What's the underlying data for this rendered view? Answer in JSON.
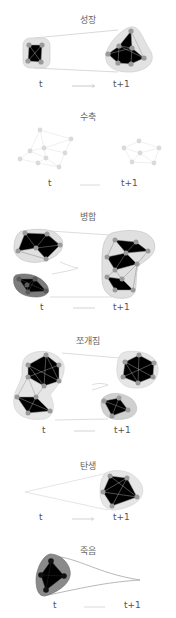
{
  "panels": [
    {
      "id": "growth",
      "title": "성장",
      "t_label": "t",
      "t1_label": "t+1"
    },
    {
      "id": "contraction",
      "title": "수축",
      "t_label": "t",
      "t1_label": "t+1"
    },
    {
      "id": "merging",
      "title": "병합",
      "t_label": "t",
      "t1_label": "t+1"
    },
    {
      "id": "splitting",
      "title": "쪼개짐",
      "t_label": "t",
      "t1_label": "t+1"
    },
    {
      "id": "birth",
      "title": "탄생",
      "t_label": "t",
      "t1_label": "t+1"
    },
    {
      "id": "death",
      "title": "죽음",
      "t_label": "t",
      "t1_label": "t+1"
    }
  ],
  "colors": {
    "node": "#9a9a9a",
    "node_faint": "#d8d8d8",
    "hull": "#e2e2e2",
    "hull_dark": "#8a8a8a",
    "edge": "#8a8a8a",
    "arrow": "#bdbdbd",
    "node_black": "#111111"
  }
}
